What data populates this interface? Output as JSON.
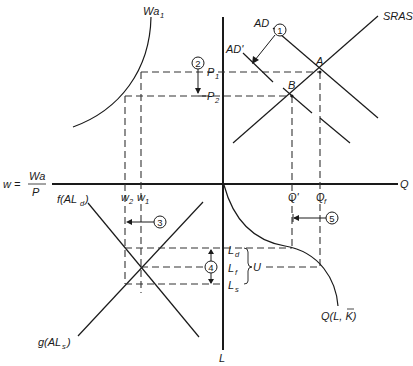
{
  "diagram": {
    "axes": {
      "horizontal_label": "Q",
      "vertical_label": "L",
      "wage_label_prefix": "w =",
      "wage_numerator": "Wa",
      "wage_denominator": "P"
    },
    "curves": {
      "wa1": "Wa",
      "wa1_sub": "1",
      "sras": "SRAS",
      "ad": "AD",
      "ad_prime": "AD'",
      "labor_demand": "f(AL",
      "labor_demand_sub": "d",
      "labor_supply": "g(AL",
      "labor_supply_sub": "s",
      "production": "Q(L, K)",
      "close_paren": ")"
    },
    "points": {
      "a": "A",
      "b": "B"
    },
    "levels": {
      "p1": "P",
      "p1_sub": "1",
      "p2": "P",
      "p2_sub": "2",
      "w1": "w",
      "w1_sub": "1",
      "w2": "w",
      "w2_sub": "2",
      "q_prime": "Q'",
      "qf": "Q",
      "qf_sub": "f",
      "ld": "L",
      "ld_sub": "d",
      "lf": "L",
      "lf_sub": "f",
      "ls": "L",
      "ls_sub": "s",
      "unemployment": "U"
    },
    "steps": [
      "1",
      "2",
      "3",
      "4",
      "5"
    ]
  }
}
